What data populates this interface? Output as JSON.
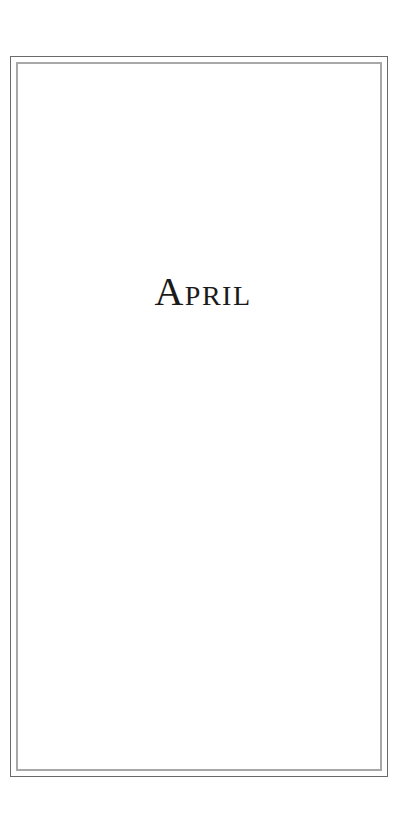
{
  "page": {
    "title": "April"
  },
  "colors": {
    "outer_border": "#6a6a6a",
    "inner_border": "#a8a8a8",
    "text": "#1a1a1a",
    "background": "#ffffff"
  }
}
